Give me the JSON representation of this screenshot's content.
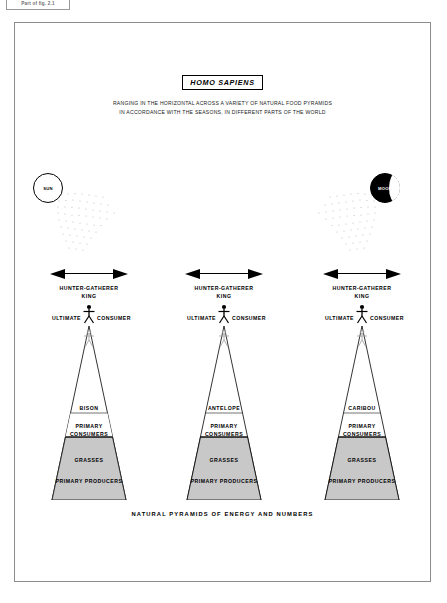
{
  "corner_tag": "Part of fig. 2.1",
  "plate": {
    "title": "HOMO SAPIENS",
    "subtitle_lines": [
      "RANGING IN THE HORIZONTAL ACROSS A VARIETY OF NATURAL FOOD PYRAMIDS",
      "IN ACCORDANCE WITH THE SEASONS, IN DIFFERENT PARTS OF THE WORLD"
    ],
    "footer_caption": "NATURAL PYRAMIDS OF ENERGY AND NUMBERS"
  },
  "celestial": {
    "sun": {
      "label": "SUN",
      "icon": "sun-icon"
    },
    "moon": {
      "label": "MOON",
      "icon": "moon-icon"
    }
  },
  "common": {
    "king_line1": "HUNTER-GATHERER",
    "king_line2": "KING",
    "ultimate": "ULTIMATE",
    "consumer": "CONSUMER",
    "primary_consumers_line1": "PRIMARY",
    "primary_consumers_line2": "CONSUMERS",
    "producers_species": "GRASSES",
    "producers_label": "PRIMARY PRODUCERS"
  },
  "colors": {
    "producer_band": "#c8c8c8",
    "consumer_band": "#ffffff",
    "ink": "#000000",
    "frame": "#8d8d8d"
  },
  "pyramids": [
    {
      "id": "pyramid-bison",
      "consumer_species": "BISON",
      "producer_species": "GRASSES",
      "producer_label": "PRIMARY PRODUCERS",
      "consumer_label_line1": "PRIMARY",
      "consumer_label_line2": "CONSUMERS"
    },
    {
      "id": "pyramid-antelope",
      "consumer_species": "ANTELOPE",
      "producer_species": "GRASSES",
      "producer_label": "PRIMARY PRODUCERS",
      "consumer_label_line1": "PRIMARY",
      "consumer_label_line2": "CONSUMERS"
    },
    {
      "id": "pyramid-caribou",
      "consumer_species": "CARIBOU",
      "producer_species": "GRASSES",
      "producer_label": "PRIMARY PRODUCERS",
      "consumer_label_line1": "PRIMARY",
      "consumer_label_line2": "CONSUMERS"
    }
  ]
}
